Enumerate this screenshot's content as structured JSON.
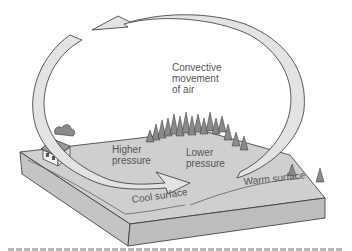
{
  "diagram": {
    "labels": {
      "convective_line1": "Convective",
      "convective_line2": "movement",
      "convective_line3": "of air",
      "higher_line1": "Higher",
      "higher_line2": "pressure",
      "lower_line1": "Lower",
      "lower_line2": "pressure",
      "cool_surface": "Cool surface",
      "warm_surface": "Warm surface"
    },
    "colors": {
      "arrow_fill": "#e3e3e3",
      "arrow_stroke": "#333333",
      "land_top": "#cfcfcf",
      "land_side": "#bdbdbd",
      "text": "#555555",
      "trees": "#8a8a8a"
    }
  }
}
